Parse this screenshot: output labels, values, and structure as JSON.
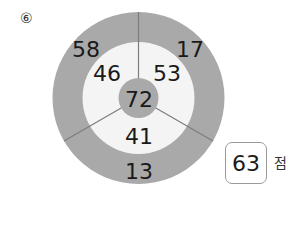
{
  "problem": {
    "number": "⑥"
  },
  "diagram": {
    "colors": {
      "outer_ring": "#a9a9a9",
      "inner_area": "#f4f4f4",
      "center": "#a9a9a9",
      "divider": "#7d7d7d"
    },
    "center_value": "72",
    "inner_values": {
      "top_left": "46",
      "top_right": "53",
      "bottom": "41"
    },
    "outer_values": {
      "top_left": "58",
      "top_right": "17",
      "bottom": "13"
    }
  },
  "answer": {
    "value": "63",
    "unit": "점"
  }
}
